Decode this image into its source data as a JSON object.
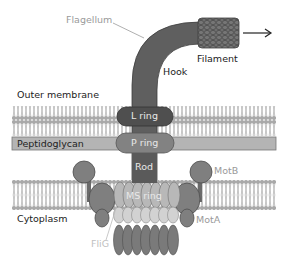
{
  "diagram": {
    "labels": {
      "flagellum": "Flagellum",
      "filament": "Filament",
      "hook": "Hook",
      "outer_membrane": "Outer membrane",
      "l_ring": "L ring",
      "peptidoglycan": "Peptidoglycan",
      "p_ring": "P ring",
      "rod": "Rod",
      "motb": "MotB",
      "cytoplasm": "Cytoplasm",
      "ms_ring": "MS ring",
      "mota": "MotA",
      "flig": "FliG"
    },
    "colors": {
      "shaft": "#5f5f5f",
      "filament": "#6a6a6a",
      "membrane_head": "#9c9c9c",
      "membrane_bg": "#dcdcdc",
      "peptidoglycan": "#b4b4b4",
      "l_ring": "#4f4f4f",
      "p_ring": "#828282",
      "motor_protein": "#7f7f7f",
      "ms_ring": "#b8b8b8",
      "c_ring_light": "#d2d2d2",
      "c_ring_dark": "#7a7a7a"
    },
    "arrow": "right-arrow"
  }
}
